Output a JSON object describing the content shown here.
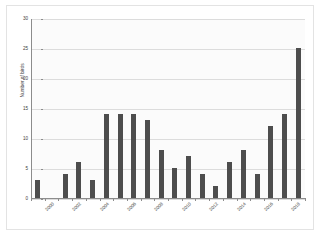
{
  "chart_data": {
    "type": "bar",
    "title": "",
    "xlabel": "",
    "ylabel": "Number of birds",
    "ylim": [
      0,
      30
    ],
    "yticks": [
      0,
      5,
      10,
      15,
      20,
      25,
      30
    ],
    "grid": true,
    "legend": false,
    "bar_color": "#4d4d4d",
    "categories": [
      "2000",
      "2001",
      "2002",
      "2003",
      "2004",
      "2005",
      "2006",
      "2007",
      "2008",
      "2009",
      "2010",
      "2011",
      "2012",
      "2013",
      "2014",
      "2015",
      "2016",
      "2017",
      "2018",
      "2019"
    ],
    "visible_tick_labels": [
      "2000",
      "2002",
      "2004",
      "2006",
      "2008",
      "2010",
      "2012",
      "2014",
      "2016",
      "2018"
    ],
    "values": [
      3,
      0,
      4,
      6,
      3,
      14,
      14,
      14,
      13,
      8,
      5,
      7,
      4,
      2,
      6,
      8,
      4,
      12,
      14,
      25
    ]
  }
}
